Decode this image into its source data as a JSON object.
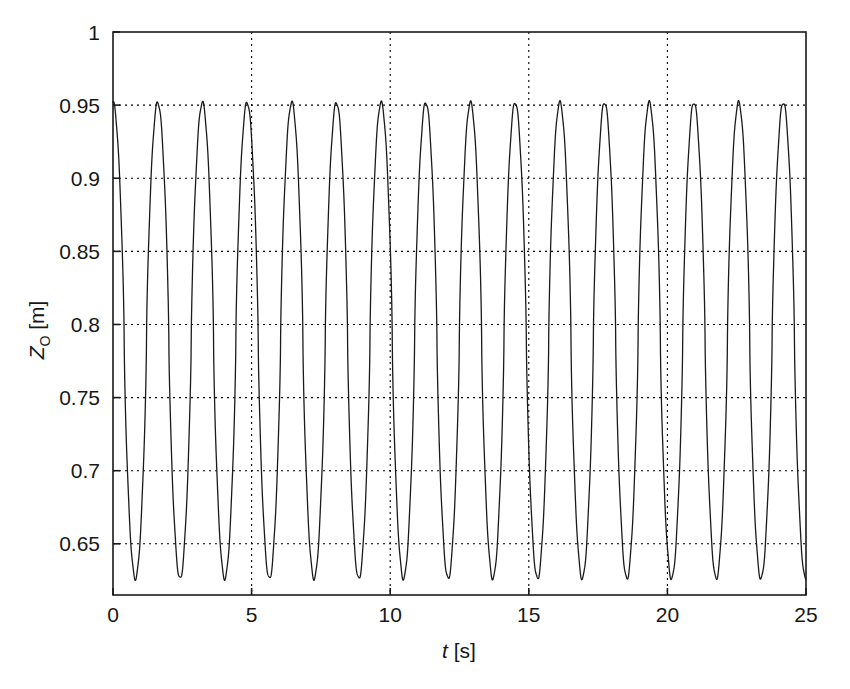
{
  "chart_data": {
    "type": "line",
    "title": "",
    "subtitle": "",
    "xlabel": "t [s]",
    "xlabel_symbol": "t",
    "xlabel_unit": "[s]",
    "ylabel": "Z_O [m]",
    "ylabel_symbol": "Z",
    "ylabel_subscript": "O",
    "ylabel_unit": "[m]",
    "xlim": [
      0,
      25
    ],
    "ylim": [
      0.615,
      1.0
    ],
    "xticks": [
      0,
      5,
      10,
      15,
      20,
      25
    ],
    "xtick_labels": [
      "0",
      "5",
      "10",
      "15",
      "20",
      "25"
    ],
    "yticks": [
      0.65,
      0.7,
      0.75,
      0.8,
      0.85,
      0.9,
      0.95,
      1
    ],
    "ytick_labels": [
      "0.65",
      "0.7",
      "0.75",
      "0.8",
      "0.85",
      "0.9",
      "0.95",
      "1"
    ],
    "grid": true,
    "grid_style": "dotted",
    "grid_color": "#000000",
    "legend": null,
    "legend_position": "none",
    "line_color": "#1a1a1a",
    "line_width": 1.3,
    "series": [
      {
        "name": "Z_O",
        "description": "Periodic oscillation of vertical coordinate Z_O with sharp pointed peaks and troughs",
        "peak_value": 0.951,
        "trough_value": 0.627,
        "mean_value": 0.789,
        "amplitude": 0.162,
        "period_s": 1.612,
        "frequency_hz": 0.62,
        "n_cycles": 15.5,
        "waveform_shape": "quasi-triangular with pointed crests and troughs and near-linear steep flanks",
        "start_value": 0.951,
        "end_value": 0.861,
        "peak_times": [
          0.0,
          1.61,
          3.22,
          4.84,
          6.45,
          8.06,
          9.67,
          11.29,
          12.9,
          14.51,
          16.13,
          17.74,
          19.35,
          20.97,
          22.58,
          24.19
        ],
        "trough_times": [
          0.81,
          2.42,
          4.03,
          5.64,
          7.26,
          8.87,
          10.48,
          12.1,
          13.71,
          15.32,
          16.94,
          18.55,
          20.16,
          21.77,
          23.39
        ],
        "peak_values": [
          0.951,
          0.951,
          0.951,
          0.951,
          0.951,
          0.951,
          0.951,
          0.951,
          0.951,
          0.951,
          0.951,
          0.951,
          0.951,
          0.951,
          0.951,
          0.951
        ],
        "trough_values": [
          0.627,
          0.627,
          0.627,
          0.627,
          0.627,
          0.627,
          0.627,
          0.627,
          0.627,
          0.627,
          0.627,
          0.627,
          0.627,
          0.627,
          0.627
        ]
      }
    ]
  },
  "axes": {
    "x_axis_name": "time-axis",
    "y_axis_name": "z-coordinate-axis"
  }
}
